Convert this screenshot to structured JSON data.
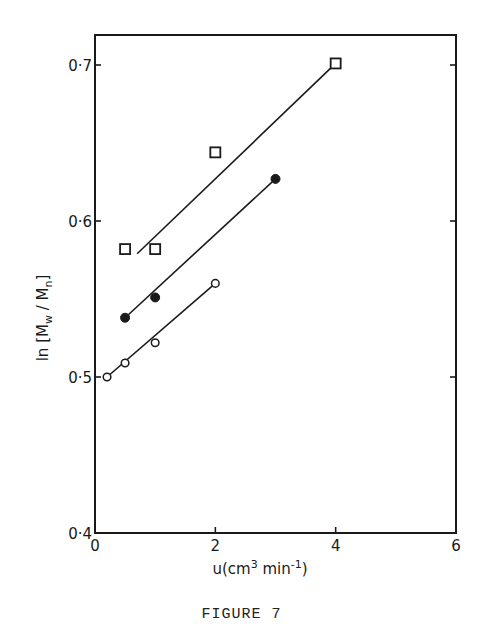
{
  "figure": {
    "caption": "FIGURE 7"
  },
  "chart_data": {
    "type": "scatter",
    "title": "",
    "xlabel": "u(cm³ min⁻¹)",
    "ylabel": "ln [M̄w / M̄n]",
    "xlim": [
      0,
      6
    ],
    "ylim": [
      0.4,
      0.72
    ],
    "xticks": [
      0,
      2,
      4,
      6
    ],
    "xtick_labels": [
      "0",
      "2",
      "4",
      "6"
    ],
    "yticks": [
      0.4,
      0.5,
      0.6,
      0.7
    ],
    "ytick_labels": [
      "0·4",
      "0·5",
      "0·6",
      "0·7"
    ],
    "grid": false,
    "legend": null,
    "series": [
      {
        "name": "open squares",
        "marker": "square-open",
        "points": [
          [
            0.5,
            0.582
          ],
          [
            1.0,
            0.582
          ],
          [
            2.0,
            0.644
          ],
          [
            4.0,
            0.701
          ]
        ],
        "fit_line": [
          [
            0.7,
            0.579
          ],
          [
            4.0,
            0.701
          ]
        ]
      },
      {
        "name": "filled circles",
        "marker": "circle-filled",
        "points": [
          [
            0.5,
            0.538
          ],
          [
            1.0,
            0.551
          ],
          [
            3.0,
            0.627
          ]
        ],
        "fit_line": [
          [
            0.5,
            0.538
          ],
          [
            3.0,
            0.627
          ]
        ]
      },
      {
        "name": "open circles",
        "marker": "circle-open",
        "points": [
          [
            0.2,
            0.5
          ],
          [
            0.5,
            0.509
          ],
          [
            1.0,
            0.522
          ],
          [
            2.0,
            0.56
          ]
        ],
        "fit_line": [
          [
            0.2,
            0.5
          ],
          [
            2.0,
            0.56
          ]
        ]
      }
    ]
  }
}
